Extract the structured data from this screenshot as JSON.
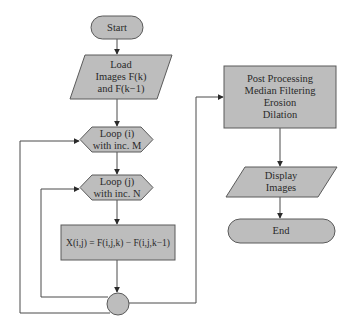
{
  "colors": {
    "shape_fill": "#bdbdbd",
    "shape_stroke": "#5a5a5a",
    "line": "#4a4a4a",
    "text": "#2a2a2a",
    "background": "#ffffff"
  },
  "nodes": {
    "start": {
      "type": "terminator",
      "text": "Start"
    },
    "load": {
      "type": "io",
      "lines": [
        "Load",
        "Images F(k)",
        "and F(k−1)"
      ]
    },
    "loop_i": {
      "type": "loop",
      "lines": [
        "Loop (i)",
        "with inc. M"
      ]
    },
    "loop_j": {
      "type": "loop",
      "lines": [
        "Loop (j)",
        "with inc. N"
      ]
    },
    "compute": {
      "type": "process",
      "text": "X(i,j) = F(i,j,k) − F(i,j,k−1)"
    },
    "connector": {
      "type": "connector",
      "text": ""
    },
    "post": {
      "type": "process",
      "lines": [
        "Post Processing",
        "Median Filtering",
        "Erosion",
        "Dilation"
      ]
    },
    "display": {
      "type": "io",
      "lines": [
        "Display",
        "Images"
      ]
    },
    "end": {
      "type": "terminator",
      "text": "End"
    }
  },
  "edges": [
    {
      "from": "start",
      "to": "load"
    },
    {
      "from": "load",
      "to": "loop_i"
    },
    {
      "from": "loop_i",
      "to": "loop_j"
    },
    {
      "from": "loop_j",
      "to": "compute"
    },
    {
      "from": "compute",
      "to": "connector"
    },
    {
      "from": "connector",
      "to": "loop_j",
      "note": "inner loop back"
    },
    {
      "from": "connector",
      "to": "loop_i",
      "note": "outer loop back"
    },
    {
      "from": "connector",
      "to": "post"
    },
    {
      "from": "post",
      "to": "display"
    },
    {
      "from": "display",
      "to": "end"
    }
  ]
}
